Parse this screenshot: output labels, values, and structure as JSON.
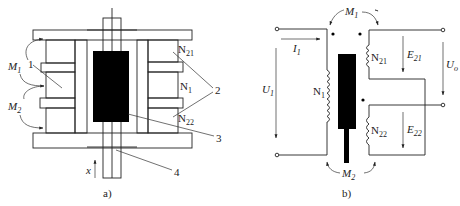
{
  "figure": {
    "panel_a": {
      "caption": "a)",
      "labels": {
        "m1": "M",
        "m1_sub": "1",
        "m2": "M",
        "m2_sub": "2",
        "part1": "1",
        "part2": "2",
        "part3": "3",
        "part4": "4",
        "n21": "N",
        "n21_sub": "21",
        "n1": "N",
        "n1_sub": "1",
        "n22": "N",
        "n22_sub": "22",
        "x_axis": "x"
      }
    },
    "panel_b": {
      "caption": "b)",
      "labels": {
        "m1": "M",
        "m1_sub": "1",
        "m2": "M",
        "m2_sub": "2",
        "i1": "I",
        "i1_sub": "1",
        "u1": "U",
        "u1_sub": "1",
        "n1": "N",
        "n1_sub": "1",
        "n21": "N",
        "n21_sub": "21",
        "n22": "N",
        "n22_sub": "22",
        "e21": "E",
        "e21_sub": "21",
        "e22": "E",
        "e22_sub": "22",
        "uo": "U",
        "uo_sub": "o"
      }
    }
  },
  "colors": {
    "line": "#222222",
    "core": "#000000",
    "background": "#ffffff"
  }
}
